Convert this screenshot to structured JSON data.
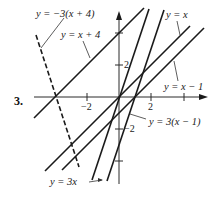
{
  "problem_number": "3.",
  "axes": {
    "x_ticks": [
      {
        "label": "−2",
        "px": 87
      },
      {
        "label": "2",
        "px": 151
      },
      {
        "label": "",
        "px": 184
      }
    ],
    "y_ticks": [
      {
        "label": "2",
        "py": 65
      },
      {
        "label": "",
        "py": 33
      },
      {
        "label": "−2",
        "py": 129
      },
      {
        "label": "",
        "py": 161
      }
    ],
    "tick_labels": {
      "x_neg2": "−2",
      "x_pos2": "2",
      "y_pos2": "2",
      "y_neg2": "−2"
    }
  },
  "lines": [
    {
      "id": "y-eq-neg3-x-plus-4",
      "label": "y = −3(x + 4)",
      "style": "dashed"
    },
    {
      "id": "y-eq-x-plus-4",
      "label": "y = x + 4",
      "style": "solid"
    },
    {
      "id": "y-eq-x",
      "label": "y = x",
      "style": "solid"
    },
    {
      "id": "y-eq-x-minus-1",
      "label": "y = x − 1",
      "style": "solid"
    },
    {
      "id": "y-eq-3x-minus-1",
      "label": "y = 3(x − 1)",
      "style": "solid"
    },
    {
      "id": "y-eq-3x",
      "label": "y = 3x",
      "style": "solid"
    }
  ],
  "labels": {
    "neg3x4": "y = −3(x + 4)",
    "xplus4": "y = x + 4",
    "yx": "y = x",
    "xminus1": "y = x − 1",
    "threexminus1": "y = 3(x − 1)",
    "threex": "y = 3x"
  },
  "colors": {
    "ink": "#1a1a1a",
    "background": "#ffffff"
  }
}
